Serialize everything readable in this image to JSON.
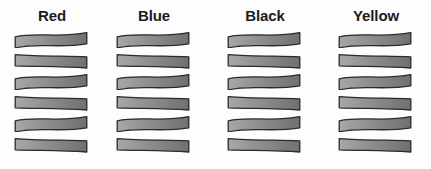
{
  "figure": {
    "background_color": "#fdfdfd",
    "columns": [
      {
        "label": "Red",
        "label_color": "#1b1b1b",
        "bar_count": 6,
        "bar_fill_left": "#a8a8a8",
        "bar_fill_mid": "#8f8f8f",
        "bar_fill_right": "#707070",
        "bar_stroke": "#2b2b2b"
      },
      {
        "label": "Blue",
        "label_color": "#1b1b1b",
        "bar_count": 6,
        "bar_fill_left": "#a8a8a8",
        "bar_fill_mid": "#8f8f8f",
        "bar_fill_right": "#707070",
        "bar_stroke": "#2b2b2b"
      },
      {
        "label": "Black",
        "label_color": "#1b1b1b",
        "bar_count": 6,
        "bar_fill_left": "#a8a8a8",
        "bar_fill_mid": "#8f8f8f",
        "bar_fill_right": "#707070",
        "bar_stroke": "#2b2b2b"
      },
      {
        "label": "Yellow",
        "label_color": "#1b1b1b",
        "bar_count": 6,
        "bar_fill_left": "#a8a8a8",
        "bar_fill_mid": "#8f8f8f",
        "bar_fill_right": "#707070",
        "bar_stroke": "#2b2b2b"
      }
    ]
  },
  "chart_data": {
    "type": "bar",
    "title": "",
    "xlabel": "",
    "ylabel": "",
    "categories": [
      "Red",
      "Blue",
      "Black",
      "Yellow"
    ],
    "series": [
      {
        "name": "count_of_bars",
        "values": [
          6,
          6,
          6,
          6
        ]
      }
    ],
    "legend_position": "none",
    "grid": false
  },
  "layout": {
    "column_left_positions": [
      14,
      116,
      227,
      338
    ],
    "column_width": 76,
    "bar_width": 74,
    "bar_height": 16,
    "bar_vertical_pitch": 21,
    "header_top": 7,
    "stack_top": 32
  }
}
